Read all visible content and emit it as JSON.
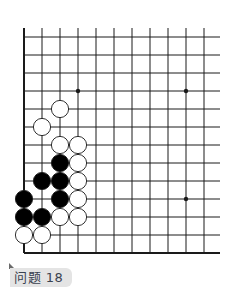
{
  "problem": {
    "label": "问题 18",
    "number": 18
  },
  "board": {
    "grid": {
      "origin_x": 24,
      "origin_y": 37,
      "spacing": 18,
      "columns": 11,
      "rows": 13,
      "top_open": true,
      "right_open": true,
      "left_edge": true,
      "bottom_edge": true
    },
    "colors": {
      "line": "#1a1a1a",
      "black_stone": "#000000",
      "white_stone": "#ffffff",
      "stone_outline": "#1a1a1a",
      "label_bg": "#e4e4e4",
      "label_text": "#3a4250"
    },
    "star_points": [
      {
        "col": 3,
        "row": 3
      },
      {
        "col": 9,
        "row": 3
      },
      {
        "col": 9,
        "row": 9
      }
    ],
    "stones": [
      {
        "color": "white",
        "col": 2,
        "row": 4
      },
      {
        "color": "white",
        "col": 1,
        "row": 5
      },
      {
        "color": "white",
        "col": 2,
        "row": 6
      },
      {
        "color": "white",
        "col": 3,
        "row": 6
      },
      {
        "color": "black",
        "col": 2,
        "row": 7
      },
      {
        "color": "white",
        "col": 3,
        "row": 7
      },
      {
        "color": "black",
        "col": 1,
        "row": 8
      },
      {
        "color": "black",
        "col": 2,
        "row": 8
      },
      {
        "color": "white",
        "col": 3,
        "row": 8
      },
      {
        "color": "black",
        "col": 0,
        "row": 9
      },
      {
        "color": "black",
        "col": 2,
        "row": 9
      },
      {
        "color": "white",
        "col": 3,
        "row": 9
      },
      {
        "color": "black",
        "col": 0,
        "row": 10
      },
      {
        "color": "black",
        "col": 1,
        "row": 10
      },
      {
        "color": "white",
        "col": 2,
        "row": 10
      },
      {
        "color": "white",
        "col": 3,
        "row": 10
      },
      {
        "color": "white",
        "col": 0,
        "row": 11
      },
      {
        "color": "white",
        "col": 1,
        "row": 11
      }
    ]
  }
}
